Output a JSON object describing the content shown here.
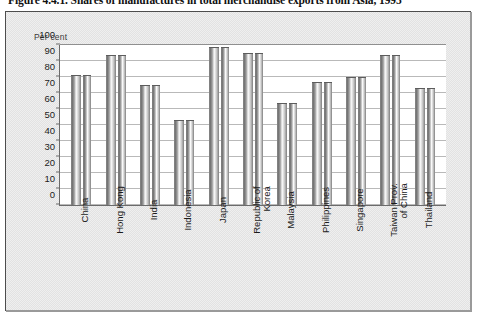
{
  "figure": {
    "caption": "Figure 4.4.1. Shares of manufactures in total merchandise exports from Asia, 1995",
    "unit_label": "Per cent",
    "frame_border_color": "#4d4d4d",
    "panel_background": "#efefef",
    "plot_background": "#ffffff",
    "bar_color": "#9e9e9e",
    "gridline_color": "#b9b9b9",
    "axis_color": "#6b6b6b"
  },
  "chart_data": {
    "type": "bar",
    "title": "Figure 4.4.1. Shares of manufactures in total merchandise exports from Asia, 1995",
    "xlabel": "",
    "ylabel": "Per cent",
    "ylim": [
      0,
      100
    ],
    "yticks": [
      0,
      10,
      20,
      30,
      40,
      50,
      60,
      70,
      80,
      90,
      100
    ],
    "ytick_labels": [
      "0",
      "10",
      "20",
      "30",
      "40",
      "50",
      "60",
      "70",
      "80",
      "90",
      "100"
    ],
    "grid": true,
    "legend": false,
    "legend_position": "none",
    "categories": [
      "China",
      "Hong Kong",
      "India",
      "Indonesia",
      "Japan",
      "Republic of Korea",
      "Malaysia",
      "Philippines",
      "Singapore",
      "Taiwan Prov. of China",
      "Thailand"
    ],
    "category_lines": [
      [
        "China"
      ],
      [
        "Hong Kong"
      ],
      [
        "India"
      ],
      [
        "Indonesia"
      ],
      [
        "Japan"
      ],
      [
        "Republic of",
        "Korea"
      ],
      [
        "Malaysia"
      ],
      [
        "Philippines"
      ],
      [
        "Singapore"
      ],
      [
        "Taiwan Prov.",
        "of China"
      ],
      [
        "Thailand"
      ]
    ],
    "values": [
      81,
      94,
      75,
      53,
      99,
      95,
      64,
      77,
      80,
      94,
      73
    ]
  }
}
